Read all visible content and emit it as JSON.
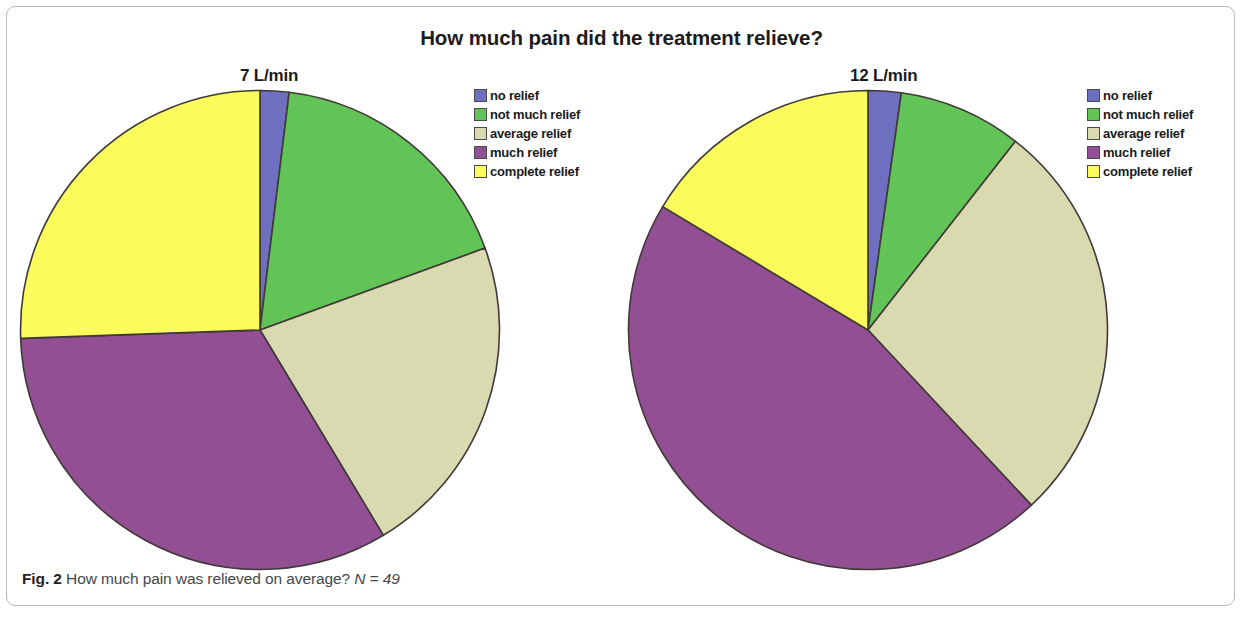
{
  "figure": {
    "title": "How much pain did the treatment relieve?",
    "caption_label": "Fig. 2",
    "caption_text": "How much pain was relieved on average?",
    "caption_n": "N = 49"
  },
  "colors": {
    "no_relief": "#6f6fc0",
    "not_much_relief": "#62c457",
    "average_relief": "#d9dab0",
    "much_relief": "#934f93",
    "complete_relief": "#fbfb5c",
    "outline": "#3f3a38",
    "frame": "#b9b9b9",
    "title_text": "#1c1c1c",
    "caption_text": "#44474a"
  },
  "legend": {
    "items": [
      {
        "label": "no relief",
        "color": "#6f6fc0"
      },
      {
        "label": "not much relief",
        "color": "#62c457"
      },
      {
        "label": "average relief",
        "color": "#d9dab0"
      },
      {
        "label": "much relief",
        "color": "#934f93"
      },
      {
        "label": "complete relief",
        "color": "#fbfb5c"
      }
    ]
  },
  "chart_data": [
    {
      "type": "pie",
      "title": "7 L/min",
      "labels": [
        "no relief",
        "not much relief",
        "average relief",
        "much relief",
        "complete relief"
      ],
      "values": [
        2.0,
        17.5,
        22.0,
        33.0,
        25.5
      ],
      "unit": "percent",
      "start_angle_deg": 0,
      "direction": "clockwise",
      "slice_angles_deg": [
        7,
        63,
        79,
        119,
        92
      ],
      "colors": [
        "#6f6fc0",
        "#62c457",
        "#d9dab0",
        "#934f93",
        "#fbfb5c"
      ],
      "legend_position": "right"
    },
    {
      "type": "pie",
      "title": "12 L/min",
      "labels": [
        "no relief",
        "not much relief",
        "average relief",
        "much relief",
        "complete relief"
      ],
      "values": [
        2.0,
        8.0,
        27.5,
        45.5,
        16.5
      ],
      "unit": "percent",
      "start_angle_deg": 0,
      "direction": "clockwise",
      "slice_angles_deg": [
        8,
        30,
        99,
        164,
        59
      ],
      "colors": [
        "#6f6fc0",
        "#62c457",
        "#d9dab0",
        "#934f93",
        "#fbfb5c"
      ],
      "legend_position": "right"
    }
  ]
}
